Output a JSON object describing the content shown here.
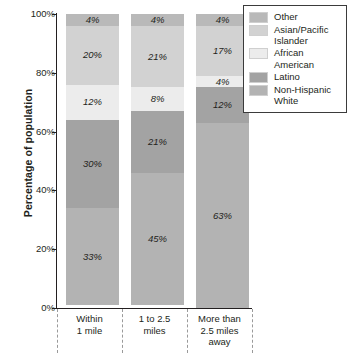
{
  "chart_data": {
    "type": "bar",
    "subtype": "stacked-100-percent",
    "title": "",
    "xlabel": "",
    "ylabel": "Percentage of population",
    "ylim": [
      0,
      100
    ],
    "ytick_labels": [
      "0%",
      "20%",
      "40%",
      "60%",
      "80%",
      "100%"
    ],
    "ytick_values": [
      0,
      20,
      40,
      60,
      80,
      100
    ],
    "grid": false,
    "legend_position": "top-right",
    "categories": [
      "Within\n1 mile",
      "1 to 2.5\nmiles",
      "More than\n2.5 miles\naway"
    ],
    "category_labels": [
      {
        "line1": "Within",
        "line2": "1 mile",
        "line3": ""
      },
      {
        "line1": "1 to 2.5",
        "line2": "miles",
        "line3": ""
      },
      {
        "line1": "More than",
        "line2": "2.5 miles",
        "line3": "away"
      }
    ],
    "series": [
      {
        "name": "Other",
        "color": "#b9b9b9",
        "values": [
          4,
          4,
          4
        ],
        "labels": [
          "4%",
          "4%",
          "4%"
        ]
      },
      {
        "name": "Asian/Pacific Islander",
        "color": "#d2d2d2",
        "values": [
          20,
          21,
          17
        ],
        "labels": [
          "20%",
          "21%",
          "17%"
        ]
      },
      {
        "name": "African American",
        "color": "#ececec",
        "values": [
          12,
          8,
          4
        ],
        "labels": [
          "12%",
          "8%",
          "4%"
        ]
      },
      {
        "name": "Latino",
        "color": "#a3a3a3",
        "values": [
          30,
          21,
          12
        ],
        "labels": [
          "30%",
          "21%",
          "12%"
        ]
      },
      {
        "name": "Non-Hispanic White",
        "color": "#b3b3b3",
        "values": [
          33,
          45,
          63
        ],
        "labels": [
          "33%",
          "45%",
          "63%"
        ]
      }
    ],
    "stack_order_top_to_bottom": [
      "Other",
      "Asian/Pacific Islander",
      "African American",
      "Latino",
      "Non-Hispanic White"
    ]
  },
  "axis": {
    "y_title": "Percentage of population",
    "ticks": [
      {
        "label": "100%",
        "value": 100
      },
      {
        "label": "80%",
        "value": 80
      },
      {
        "label": "60%",
        "value": 60
      },
      {
        "label": "40%",
        "value": 40
      },
      {
        "label": "20%",
        "value": 20
      },
      {
        "label": "0%",
        "value": 0
      }
    ]
  },
  "legend": {
    "items": [
      {
        "label_line1": "Other",
        "label_line2": "",
        "color": "#b9b9b9"
      },
      {
        "label_line1": "Asian/Pacific",
        "label_line2": "Islander",
        "color": "#d2d2d2"
      },
      {
        "label_line1": "African",
        "label_line2": "American",
        "color": "#ececec"
      },
      {
        "label_line1": "Latino",
        "label_line2": "",
        "color": "#a3a3a3"
      },
      {
        "label_line1": "Non-Hispanic",
        "label_line2": "White",
        "color": "#b3b3b3"
      }
    ]
  },
  "colors": {
    "axis": "#231f20",
    "text": "#231f20",
    "legend_border": "#3b3b3b",
    "divider": "#9a9a9a",
    "background": "#ffffff"
  }
}
